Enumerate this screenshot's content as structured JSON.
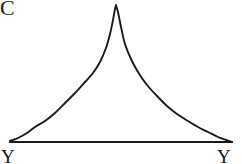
{
  "figure": {
    "panel_letter": "C",
    "background_color": "#ffffff",
    "ink_color": "#1a1a1a"
  },
  "axis": {
    "left_label": "Y",
    "right_label": "Y",
    "baseline_y": 142,
    "baseline_x_start": 10,
    "baseline_x_end": 232
  },
  "chart_data": {
    "type": "line",
    "title": "C",
    "xlabel": "",
    "ylabel": "",
    "subtitle": "",
    "grid": false,
    "legend": null,
    "xlim": [
      10,
      232
    ],
    "ylim": [
      0,
      137
    ],
    "axis_tick_labels": {
      "x": [
        "Y",
        "Y"
      ],
      "y": []
    },
    "annotations": [
      "Sharp-peaked leptokurtic density curve with long tails meeting the horizontal baseline"
    ],
    "series": [
      {
        "name": "density",
        "x": [
          10,
          18,
          27,
          35,
          45,
          55,
          65,
          75,
          85,
          93,
          100,
          106,
          110,
          113,
          115,
          116,
          118,
          121,
          125,
          131,
          138,
          147,
          157,
          167,
          177,
          188,
          198,
          208,
          218,
          226,
          232
        ],
        "y": [
          141,
          138,
          133,
          127,
          121,
          113,
          103,
          93,
          82,
          73,
          62,
          48,
          34,
          20,
          9,
          5,
          12,
          27,
          44,
          59,
          72,
          85,
          96,
          106,
          114,
          121,
          127,
          132,
          137,
          140,
          142
        ]
      }
    ],
    "peak": {
      "x": 116,
      "y": 5
    }
  }
}
